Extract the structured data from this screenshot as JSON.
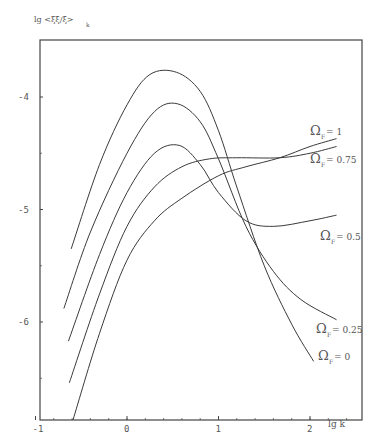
{
  "chart_data": {
    "type": "line",
    "title": "",
    "xlabel": "lg k",
    "ylabel": "lg <ξξ/ξ>_k",
    "xlim": [
      -1,
      2.57
    ],
    "ylim": [
      -6.87,
      -3.48
    ],
    "x_ticks": [
      -1,
      0,
      1,
      2
    ],
    "x_tick_labels": [
      "-1",
      "0",
      "1",
      "2"
    ],
    "y_ticks": [
      -4,
      -5,
      -6
    ],
    "y_tick_labels": [
      "-4",
      "-5",
      "-6"
    ],
    "grid": false,
    "legend": "inline labels at right end of curves",
    "series": [
      {
        "name": "Ω_F = 0",
        "label": "Ω = 0",
        "points": [
          [
            -0.61,
            -5.35
          ],
          [
            -0.3,
            -4.6
          ],
          [
            0.0,
            -4.07
          ],
          [
            0.25,
            -3.8
          ],
          [
            0.54,
            -3.78
          ],
          [
            0.8,
            -3.95
          ],
          [
            1.0,
            -4.3
          ],
          [
            1.2,
            -4.8
          ],
          [
            1.5,
            -5.5
          ],
          [
            1.8,
            -6.02
          ],
          [
            2.04,
            -6.35
          ]
        ]
      },
      {
        "name": "Ω_F = 0.25",
        "label": "Ω = 0.25",
        "points": [
          [
            -0.69,
            -5.88
          ],
          [
            -0.4,
            -5.2
          ],
          [
            0.0,
            -4.5
          ],
          [
            0.3,
            -4.13
          ],
          [
            0.55,
            -4.06
          ],
          [
            0.8,
            -4.22
          ],
          [
            1.0,
            -4.55
          ],
          [
            1.3,
            -5.15
          ],
          [
            1.6,
            -5.55
          ],
          [
            1.9,
            -5.8
          ],
          [
            2.29,
            -5.98
          ]
        ]
      },
      {
        "name": "Ω_F = 0.5",
        "label": "Ω = 0.5",
        "points": [
          [
            -0.64,
            -6.17
          ],
          [
            -0.3,
            -5.4
          ],
          [
            0.0,
            -4.85
          ],
          [
            0.3,
            -4.5
          ],
          [
            0.57,
            -4.43
          ],
          [
            0.8,
            -4.6
          ],
          [
            1.0,
            -4.85
          ],
          [
            1.3,
            -5.1
          ],
          [
            1.6,
            -5.15
          ],
          [
            2.0,
            -5.1
          ],
          [
            2.29,
            -5.05
          ]
        ]
      },
      {
        "name": "Ω_F = 0.75",
        "label": "Ω = 0.75",
        "points": [
          [
            -0.63,
            -6.54
          ],
          [
            -0.3,
            -5.75
          ],
          [
            0.0,
            -5.15
          ],
          [
            0.3,
            -4.8
          ],
          [
            0.6,
            -4.62
          ],
          [
            0.9,
            -4.55
          ],
          [
            1.2,
            -4.54
          ],
          [
            1.67,
            -4.54
          ],
          [
            2.0,
            -4.5
          ],
          [
            2.29,
            -4.44
          ]
        ]
      },
      {
        "name": "Ω_F = 1",
        "label": "Ω = 1",
        "points": [
          [
            -0.59,
            -6.87
          ],
          [
            -0.3,
            -6.1
          ],
          [
            0.0,
            -5.45
          ],
          [
            0.3,
            -5.1
          ],
          [
            0.6,
            -4.9
          ],
          [
            1.0,
            -4.7
          ],
          [
            1.3,
            -4.62
          ],
          [
            1.67,
            -4.54
          ],
          [
            2.0,
            -4.44
          ],
          [
            2.29,
            -4.37
          ]
        ]
      }
    ]
  },
  "plot": {
    "px_left": 40,
    "px_right": 362,
    "px_top": 40,
    "px_bottom": 420,
    "x0_px": 127,
    "x_unit_px": 91.5,
    "y0_val": -4,
    "y0_px": 97,
    "y_unit_px": 112.5
  },
  "labels": {
    "y_axis_title": "lg <ξξ/ξ>",
    "y_axis_sub": "k",
    "x_axis_title": "lg k",
    "curves": [
      {
        "text": "Ω",
        "sub": "F",
        "val": "= 1",
        "x": 310,
        "y": 135
      },
      {
        "text": "Ω",
        "sub": "F",
        "val": "= 0.75",
        "x": 310,
        "y": 163
      },
      {
        "text": "Ω",
        "sub": "F",
        "val": "= 0.5",
        "x": 320,
        "y": 240
      },
      {
        "text": "Ω",
        "sub": "F",
        "val": "= 0.25",
        "x": 316,
        "y": 333
      },
      {
        "text": "Ω",
        "sub": "F",
        "val": "= 0",
        "x": 318,
        "y": 360
      }
    ]
  },
  "colors": {
    "line": "#3a3a3a",
    "axis": "#444444",
    "text": "#555555"
  }
}
